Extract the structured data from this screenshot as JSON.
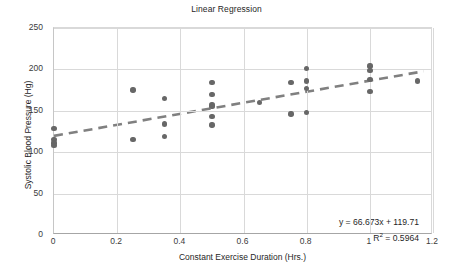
{
  "chart_data": {
    "type": "scatter",
    "title": "Linear Regression",
    "xlabel": "Constant Exercise Duration (Hrs.)",
    "ylabel": "Systolic Blood Pressure (Hg)",
    "xlim": [
      0,
      1.2
    ],
    "ylim": [
      0,
      250
    ],
    "xticks": [
      "0",
      "0.2",
      "0.4",
      "0.6",
      "0.8",
      "1",
      "1.2"
    ],
    "xtick_values": [
      0,
      0.2,
      0.4,
      0.6,
      0.8,
      1,
      1.2
    ],
    "yticks": [
      "0",
      "50",
      "100",
      "150",
      "200",
      "250"
    ],
    "ytick_values": [
      0,
      50,
      100,
      150,
      200,
      250
    ],
    "grid": "horizontal-and-vertical",
    "legend": "none",
    "marker_color": "#676767",
    "trendline_color": "#808080",
    "trendline_style": "dashed",
    "gridline_color": "#d9d9d9",
    "series": [
      {
        "name": "Systolic Blood Pressure",
        "points": [
          [
            0.0,
            129
          ],
          [
            0.0,
            115
          ],
          [
            0.0,
            111
          ],
          [
            0.0,
            108
          ],
          [
            0.25,
            175
          ],
          [
            0.25,
            115
          ],
          [
            0.35,
            165
          ],
          [
            0.35,
            134
          ],
          [
            0.35,
            119
          ],
          [
            0.5,
            184
          ],
          [
            0.5,
            170
          ],
          [
            0.5,
            157
          ],
          [
            0.5,
            155
          ],
          [
            0.5,
            143
          ],
          [
            0.5,
            133
          ],
          [
            0.65,
            160
          ],
          [
            0.75,
            184
          ],
          [
            0.75,
            146
          ],
          [
            0.8,
            201
          ],
          [
            0.8,
            186
          ],
          [
            0.8,
            177
          ],
          [
            0.8,
            148
          ],
          [
            1.0,
            204
          ],
          [
            1.0,
            199
          ],
          [
            1.0,
            188
          ],
          [
            1.0,
            173
          ],
          [
            1.15,
            186
          ]
        ]
      }
    ],
    "trendline": {
      "slope": 66.673,
      "intercept": 119.71,
      "x_start": 0.0,
      "x_end": 1.17,
      "equation_label": "y = 66.673x + 119.71",
      "r_squared_prefix": "R",
      "r_squared_exponent": "2",
      "r_squared_label": " = 0.5964",
      "r_squared_value": 0.5964
    }
  }
}
